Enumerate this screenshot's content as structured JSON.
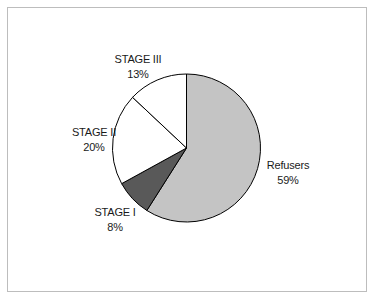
{
  "chart_data": {
    "type": "pie",
    "title": "",
    "categories": [
      "Refusers",
      "STAGE I",
      "STAGE II",
      "STAGE III"
    ],
    "values": [
      59,
      8,
      20,
      13
    ],
    "unit": "%",
    "colors": [
      "#c4c4c4",
      "#595959",
      "#ffffff",
      "#ffffff"
    ],
    "start_angle": "12 o'clock",
    "direction": "clockwise",
    "legend": "none (data labels outside slices)",
    "labels": [
      {
        "name": "Refusers",
        "value": "59%"
      },
      {
        "name": "STAGE I",
        "value": "8%"
      },
      {
        "name": "STAGE II",
        "value": "20%"
      },
      {
        "name": "STAGE III",
        "value": "13%"
      }
    ]
  }
}
